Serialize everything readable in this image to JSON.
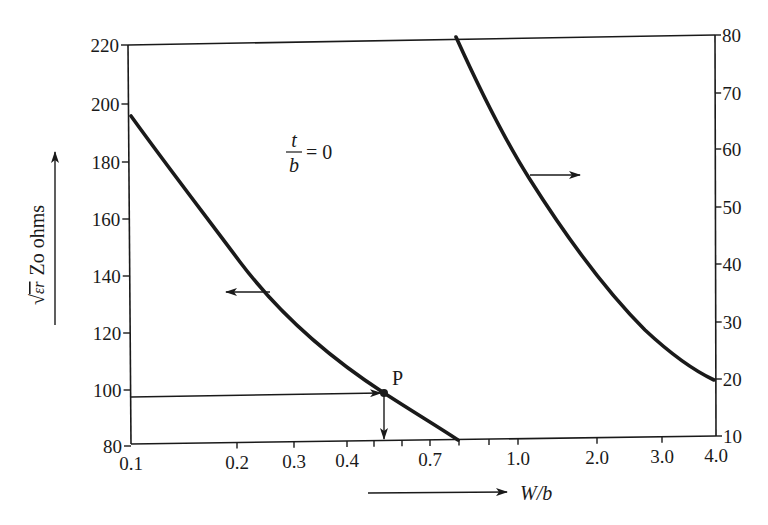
{
  "chart_data": {
    "type": "line",
    "title": "",
    "xlabel": "W/b",
    "ylabel_left": "√εr Zo ohms",
    "ylabel_right": "",
    "x_scale": "log-like (nonuniform)",
    "xlim": [
      0.1,
      4.0
    ],
    "ylim_left": [
      80,
      220
    ],
    "ylim_right": [
      10,
      80
    ],
    "grid": false,
    "legend": null,
    "x_tick_labels": [
      "0.1",
      "0.2",
      "0.3",
      "0.4",
      "0.7",
      "1.0",
      "2.0",
      "3.0",
      "4.0"
    ],
    "x_minor_ticks": [
      0.5,
      0.6,
      0.8,
      0.9
    ],
    "y_left_tick_labels": [
      "80",
      "100",
      "120",
      "140",
      "160",
      "180",
      "200",
      "220"
    ],
    "y_right_tick_labels": [
      "10",
      "20",
      "30",
      "40",
      "50",
      "60",
      "70",
      "80"
    ],
    "series": [
      {
        "name": "left-scale curve (t/b = 0)",
        "axis": "left",
        "x": [
          0.1,
          0.15,
          0.2,
          0.25,
          0.3,
          0.35,
          0.4,
          0.53,
          0.65,
          0.8
        ],
        "y": [
          198,
          184,
          176,
          166,
          156,
          145,
          134,
          97,
          88,
          80
        ]
      },
      {
        "name": "right-scale curve (t/b = 0)",
        "axis": "right",
        "x": [
          0.8,
          0.9,
          1.0,
          1.15,
          1.4,
          1.8,
          2.2,
          2.7,
          3.3,
          4.0
        ],
        "y": [
          80,
          71,
          63,
          56,
          50,
          42,
          34,
          28,
          23,
          20
        ]
      }
    ],
    "annotations": [
      {
        "text": "t/b = 0",
        "type": "parameter label"
      },
      {
        "text": "P",
        "type": "point label",
        "x": 0.53,
        "y_left": 97
      },
      {
        "text": "←",
        "type": "arrow pointing left curve to left axis"
      },
      {
        "text": "→",
        "type": "arrow pointing right curve to right axis"
      }
    ]
  },
  "labels": {
    "param_num": "t",
    "param_den": "b",
    "param_eq": "= 0",
    "point": "P",
    "xlabel": "W/b",
    "ylabel_sqrt": "√",
    "ylabel_eps": "εr",
    "ylabel_rest": "Zo ohms"
  },
  "ticks": {
    "left": [
      {
        "label": "220",
        "y": 45
      },
      {
        "label": "200",
        "y": 104
      },
      {
        "label": "180",
        "y": 162
      },
      {
        "label": "160",
        "y": 219
      },
      {
        "label": "140",
        "y": 276
      },
      {
        "label": "120",
        "y": 333
      },
      {
        "label": "100",
        "y": 390
      },
      {
        "label": "80",
        "y": 446
      }
    ],
    "right": [
      {
        "label": "80",
        "y": 35
      },
      {
        "label": "70",
        "y": 93
      },
      {
        "label": "60",
        "y": 149
      },
      {
        "label": "50",
        "y": 207
      },
      {
        "label": "40",
        "y": 264
      },
      {
        "label": "30",
        "y": 322
      },
      {
        "label": "20",
        "y": 379
      },
      {
        "label": "10",
        "y": 436
      }
    ],
    "bottom": [
      {
        "label": "0.1",
        "x": 131
      },
      {
        "label": "0.2",
        "x": 237
      },
      {
        "label": "0.3",
        "x": 294
      },
      {
        "label": "0.4",
        "x": 347
      },
      {
        "label": "",
        "x": 374
      },
      {
        "label": "",
        "x": 402
      },
      {
        "label": "0.7",
        "x": 430
      },
      {
        "label": "",
        "x": 459
      },
      {
        "label": "",
        "x": 489
      },
      {
        "label": "1.0",
        "x": 518
      },
      {
        "label": "2.0",
        "x": 597
      },
      {
        "label": "3.0",
        "x": 662
      },
      {
        "label": "4.0",
        "x": 716
      }
    ]
  },
  "colors": {
    "ink": "#1a1a1a",
    "background": "#ffffff"
  }
}
